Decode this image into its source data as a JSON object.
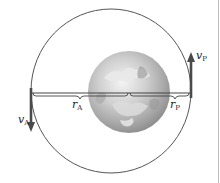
{
  "diagram": {
    "title": "",
    "orbit": {
      "shape": "ellipse",
      "stroke_color": "#555555"
    },
    "central_body": {
      "name": "Earth",
      "colors": {
        "light": "#f2f2f2",
        "mid": "#bdbdbd",
        "dark": "#8a8a8a"
      }
    },
    "labels": {
      "v_a": {
        "symbol": "v",
        "subscript": "A"
      },
      "v_p": {
        "symbol": "v",
        "subscript": "P"
      },
      "r_a": {
        "symbol": "r",
        "subscript": "A"
      },
      "r_p": {
        "symbol": "r",
        "subscript": "P"
      }
    },
    "vectors": [
      {
        "name": "velocity at apogee",
        "label": "v_A",
        "direction": "down"
      },
      {
        "name": "velocity at perigee",
        "label": "v_P",
        "direction": "up"
      }
    ],
    "distances": [
      {
        "name": "apogee distance",
        "label": "r_A"
      },
      {
        "name": "perigee distance",
        "label": "r_P"
      }
    ],
    "vector_color": "#4a4a4a",
    "line_color": "#444444"
  }
}
